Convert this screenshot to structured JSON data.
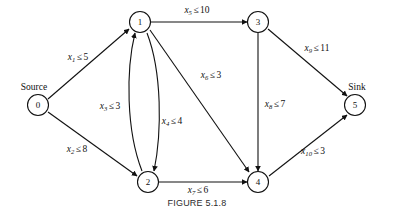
{
  "figure": {
    "caption": "FIGURE 5.1.8",
    "type": "network-flow-diagram"
  },
  "terminals": {
    "source_label": "Source",
    "sink_label": "Sink"
  },
  "nodes": [
    {
      "id": "0",
      "label": "0",
      "x": 38,
      "y": 105,
      "role": "source"
    },
    {
      "id": "1",
      "label": "1",
      "x": 140,
      "y": 22,
      "role": "intermediate"
    },
    {
      "id": "2",
      "label": "2",
      "x": 148,
      "y": 182,
      "role": "intermediate"
    },
    {
      "id": "3",
      "label": "3",
      "x": 258,
      "y": 22,
      "role": "intermediate"
    },
    {
      "id": "4",
      "label": "4",
      "x": 258,
      "y": 182,
      "role": "intermediate"
    },
    {
      "id": "5",
      "label": "5",
      "x": 355,
      "y": 105,
      "role": "sink"
    }
  ],
  "edges": [
    {
      "id": "x1",
      "from": "0",
      "to": "1",
      "var": "x",
      "sub": "1",
      "rel": "≤",
      "cap": "5",
      "label": "x₁ ≤ 5",
      "label_x": 78,
      "label_y": 58
    },
    {
      "id": "x2",
      "from": "0",
      "to": "2",
      "var": "x",
      "sub": "2",
      "rel": "≤",
      "cap": "8",
      "label": "x₂ ≤ 8",
      "label_x": 77,
      "label_y": 150
    },
    {
      "id": "x3",
      "from": "2",
      "to": "1",
      "var": "x",
      "sub": "3",
      "rel": "≤",
      "cap": "3",
      "label": "x₃ ≤ 3",
      "label_x": 110,
      "label_y": 107
    },
    {
      "id": "x4",
      "from": "1",
      "to": "2",
      "var": "x",
      "sub": "4",
      "rel": "≤",
      "cap": "4",
      "label": "x₄ ≤ 4",
      "label_x": 172,
      "label_y": 122
    },
    {
      "id": "x5",
      "from": "1",
      "to": "3",
      "var": "x",
      "sub": "5",
      "rel": "≤",
      "cap": "10",
      "label": "x₅ ≤ 10",
      "label_x": 197,
      "label_y": 11
    },
    {
      "id": "x6",
      "from": "1",
      "to": "4",
      "var": "x",
      "sub": "6",
      "rel": "≤",
      "cap": "3",
      "label": "x₆ ≤ 3",
      "label_x": 211,
      "label_y": 76
    },
    {
      "id": "x7",
      "from": "2",
      "to": "4",
      "var": "x",
      "sub": "7",
      "rel": "≤",
      "cap": "6",
      "label": "x₇ ≤ 6",
      "label_x": 198,
      "label_y": 191
    },
    {
      "id": "x8",
      "from": "3",
      "to": "4",
      "var": "x",
      "sub": "8",
      "rel": "≤",
      "cap": "7",
      "label": "x₈ ≤ 7",
      "label_x": 275,
      "label_y": 105
    },
    {
      "id": "x9",
      "from": "3",
      "to": "5",
      "var": "x",
      "sub": "9",
      "rel": "≤",
      "cap": "11",
      "label": "x₉ ≤ 11",
      "label_x": 317,
      "label_y": 49
    },
    {
      "id": "x10",
      "from": "4",
      "to": "5",
      "var": "x",
      "sub": "10",
      "rel": "≤",
      "cap": "3",
      "label": "x₁₀ ≤ 3",
      "label_x": 313,
      "label_y": 152
    }
  ],
  "style": {
    "stroke_color": "#111111",
    "node_fill": "#ffffff",
    "background": "#ffffff",
    "caption_color": "#2b2b2b"
  }
}
